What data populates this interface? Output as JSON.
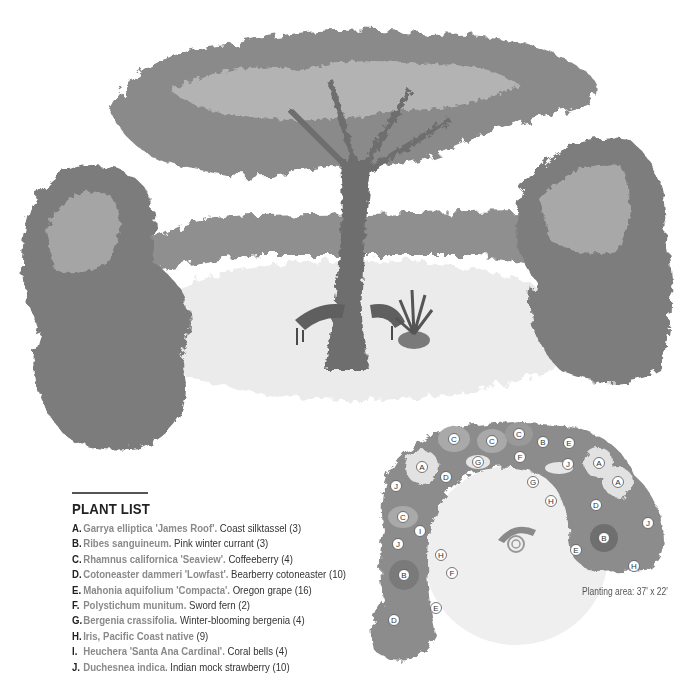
{
  "illustration": {
    "subject": "shade garden perspective with central tree, curved bench and potted fern"
  },
  "plant_list": {
    "title": "PLANT LIST",
    "items": [
      {
        "letter": "A.",
        "latin": "Garrya elliptica 'James Roof'.",
        "common": "Coast silktassel",
        "qty": "(3)"
      },
      {
        "letter": "B.",
        "latin": "Ribes sanguineum.",
        "common": "Pink winter currant",
        "qty": "(3)"
      },
      {
        "letter": "C.",
        "latin": "Rhamnus californica 'Seaview'.",
        "common": "Coffeeberry",
        "qty": "(4)"
      },
      {
        "letter": "D.",
        "latin": "Cotoneaster dammeri 'Lowfast'.",
        "common": "Bearberry cotoneaster",
        "qty": "(10)"
      },
      {
        "letter": "E.",
        "latin": "Mahonia aquifolium 'Compacta'.",
        "common": "Oregon grape",
        "qty": "(16)"
      },
      {
        "letter": "F.",
        "latin": "Polystichum munitum.",
        "common": "Sword fern",
        "qty": "(2)"
      },
      {
        "letter": "G.",
        "latin": "Bergenia crassifolia.",
        "common": "Winter-blooming bergenia",
        "qty": "(4)"
      },
      {
        "letter": "H.",
        "latin": "Iris, Pacific Coast native",
        "common": "",
        "qty": "(9)"
      },
      {
        "letter": "I.",
        "latin": "Heuchera 'Santa Ana Cardinal'.",
        "common": "Coral bells",
        "qty": "(4)"
      },
      {
        "letter": "J.",
        "latin": "Duchesnea indica.",
        "common": "Indian mock strawberry",
        "qty": "(10)"
      }
    ]
  },
  "plan": {
    "caption": "Planting area: 37' x 22'",
    "labels": [
      {
        "t": "C",
        "x": 88,
        "y": 19
      },
      {
        "t": "C",
        "x": 126,
        "y": 21
      },
      {
        "t": "C",
        "x": 153,
        "y": 14
      },
      {
        "t": "B",
        "x": 177,
        "y": 22
      },
      {
        "t": "E",
        "x": 203,
        "y": 23
      },
      {
        "t": "A",
        "x": 56,
        "y": 47
      },
      {
        "t": "G",
        "x": 112,
        "y": 42
      },
      {
        "t": "F",
        "x": 154,
        "y": 37
      },
      {
        "t": "J",
        "x": 202,
        "y": 44
      },
      {
        "t": "A",
        "x": 233,
        "y": 43
      },
      {
        "t": "D",
        "x": 80,
        "y": 57
      },
      {
        "t": "G",
        "x": 167,
        "y": 62
      },
      {
        "t": "A",
        "x": 252,
        "y": 62
      },
      {
        "t": "J",
        "x": 30,
        "y": 66
      },
      {
        "t": "H",
        "x": 185,
        "y": 81
      },
      {
        "t": "D",
        "x": 230,
        "y": 85
      },
      {
        "t": "C",
        "x": 37,
        "y": 97
      },
      {
        "t": "I",
        "x": 54,
        "y": 111
      },
      {
        "t": "J",
        "x": 282,
        "y": 103
      },
      {
        "t": "B",
        "x": 238,
        "y": 118
      },
      {
        "t": "J",
        "x": 32,
        "y": 124
      },
      {
        "t": "E",
        "x": 210,
        "y": 130
      },
      {
        "t": "H",
        "x": 75,
        "y": 135
      },
      {
        "t": "F",
        "x": 86,
        "y": 153
      },
      {
        "t": "B",
        "x": 38,
        "y": 155
      },
      {
        "t": "H",
        "x": 268,
        "y": 146
      },
      {
        "t": "E",
        "x": 70,
        "y": 188
      },
      {
        "t": "D",
        "x": 28,
        "y": 200
      }
    ]
  }
}
